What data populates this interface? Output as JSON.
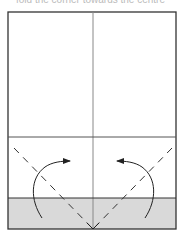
{
  "caption": "fold the corner towards the centre",
  "diagram": {
    "colors": {
      "outline": "#333333",
      "crease": "#888888",
      "shade": "#d9d9d9",
      "dash": "#333333",
      "arrow": "#222222"
    },
    "elements": [
      {
        "type": "paper-rectangle"
      },
      {
        "type": "vertical-center-crease"
      },
      {
        "type": "horizontal-crease"
      },
      {
        "type": "shaded-bottom-band"
      },
      {
        "type": "dashed-fold-line-left"
      },
      {
        "type": "dashed-fold-line-right"
      },
      {
        "type": "curved-arrow-left"
      },
      {
        "type": "curved-arrow-right"
      }
    ]
  }
}
